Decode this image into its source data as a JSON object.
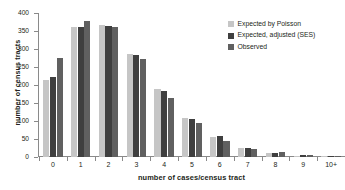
{
  "chart_data": {
    "type": "bar",
    "title": "",
    "xlabel": "number of cases/census tract",
    "ylabel": "number of census tracts",
    "categories": [
      "0",
      "1",
      "2",
      "3",
      "4",
      "5",
      "6",
      "7",
      "8",
      "9",
      "10+"
    ],
    "series": [
      {
        "name": "Expected by Poisson",
        "color": "#c6c6c6",
        "values": [
          215,
          362,
          368,
          287,
          188,
          107,
          56,
          26,
          11,
          4,
          2
        ]
      },
      {
        "name": "Expected, adjusted (SES)",
        "color": "#3f3f3f",
        "values": [
          222,
          362,
          365,
          283,
          183,
          106,
          57,
          24,
          12,
          5,
          2
        ]
      },
      {
        "name": "Observed",
        "color": "#606060",
        "values": [
          275,
          377,
          360,
          273,
          164,
          94,
          44,
          23,
          14,
          5,
          1
        ]
      }
    ],
    "ylim": [
      0,
      400
    ],
    "yticks": [
      "0",
      "50",
      "100",
      "150",
      "200",
      "250",
      "300",
      "350",
      "400"
    ],
    "grid": false,
    "legend_position": "top-right"
  },
  "legend": {
    "items": [
      {
        "label": "Expected by Poisson",
        "swatch": "#c6c6c6"
      },
      {
        "label": "Expected, adjusted (SES)",
        "swatch": "#3f3f3f"
      },
      {
        "label": "Observed",
        "swatch": "#606060"
      }
    ]
  }
}
